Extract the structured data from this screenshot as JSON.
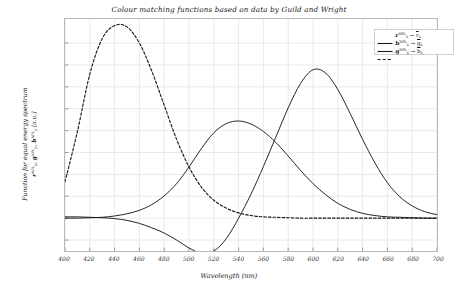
{
  "chart_data": {
    "type": "line",
    "title": "Colour matching functions based on data by Guild and Wright",
    "xlabel": "Wavelength (nm)",
    "ylabel_line1": "Function for equal energy spectrum",
    "ylabel_line2": "ₓ̅rₓᴺᴾᴸ, ̅gₓ, ̅bₓ [a.u.]",
    "ylabel_plain": "Function for equal energy spectrum r_NPL, g_NPL, b_NPL [a.u.]",
    "xlim": [
      400,
      700
    ],
    "ylim": [
      -0.075,
      0.455
    ],
    "grid": true,
    "legend_position": "upper right",
    "xticks": [
      400,
      420,
      440,
      460,
      480,
      500,
      520,
      540,
      560,
      580,
      600,
      620,
      640,
      660,
      680,
      700
    ],
    "xtick_labels": [
      "400",
      "420",
      "440",
      "460",
      "480",
      "500",
      "520",
      "540",
      "560",
      "580",
      "600",
      "620",
      "640",
      "660",
      "680",
      "700"
    ],
    "yticks": [
      -0.05,
      0,
      0.05,
      0.1,
      0.15,
      0.2,
      0.25,
      0.3,
      0.35,
      0.4
    ],
    "ytick_labels": [
      "-0.05",
      "0",
      "0.05",
      "0.1",
      "0.15",
      "0.2",
      "0.25",
      "0.3",
      "0.35",
      "0.4"
    ],
    "x": [
      400,
      410,
      420,
      430,
      440,
      450,
      460,
      470,
      480,
      490,
      500,
      510,
      520,
      530,
      540,
      550,
      560,
      570,
      580,
      590,
      600,
      610,
      620,
      630,
      640,
      650,
      660,
      670,
      680,
      690,
      700
    ],
    "series": [
      {
        "name": "r-bar",
        "label_plain": "r_lambda^NPL -> r-bar_lambda",
        "style": "solid",
        "color": "#1a1a1a",
        "values": [
          0.003,
          0.003,
          0.002,
          0.001,
          -0.001,
          -0.005,
          -0.012,
          -0.022,
          -0.034,
          -0.05,
          -0.068,
          -0.08,
          -0.075,
          -0.047,
          0.0,
          0.055,
          0.118,
          0.185,
          0.252,
          0.308,
          0.339,
          0.332,
          0.294,
          0.239,
          0.18,
          0.126,
          0.081,
          0.049,
          0.028,
          0.015,
          0.008
        ]
      },
      {
        "name": "g-bar",
        "label_plain": "g_lambda^NPL -> g-bar_lambda",
        "style": "solid",
        "color": "#1a1a1a",
        "values": [
          0.0,
          0.0,
          0.001,
          0.002,
          0.005,
          0.01,
          0.018,
          0.031,
          0.051,
          0.079,
          0.117,
          0.159,
          0.195,
          0.216,
          0.222,
          0.215,
          0.198,
          0.173,
          0.142,
          0.109,
          0.079,
          0.054,
          0.034,
          0.02,
          0.011,
          0.006,
          0.003,
          0.002,
          0.001,
          0.0,
          0.0
        ]
      },
      {
        "name": "b-bar",
        "label_plain": "b_lambda^NPL -> b-bar_lambda",
        "style": "dashed",
        "color": "#1a1a1a",
        "values": [
          0.083,
          0.198,
          0.329,
          0.41,
          0.44,
          0.437,
          0.4,
          0.336,
          0.258,
          0.18,
          0.117,
          0.071,
          0.041,
          0.023,
          0.012,
          0.006,
          0.003,
          0.002,
          0.001,
          0.0,
          0.0,
          0.0,
          0.0,
          0.0,
          0.0,
          0.0,
          0.0,
          0.0,
          0.0,
          0.0,
          0.0
        ]
      }
    ],
    "legend": [
      {
        "id": "legend-r",
        "base": "r",
        "sup": "NPL",
        "arrow": "→",
        "target": "r"
      },
      {
        "id": "legend-g",
        "base": "b",
        "sup": "NPL",
        "arrow": "→",
        "target": "g"
      },
      {
        "id": "legend-b",
        "base": "g",
        "sup": "NPL",
        "arrow": "→",
        "target": "b"
      }
    ]
  }
}
